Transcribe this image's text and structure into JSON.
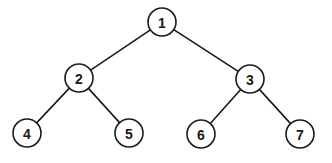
{
  "diagram": {
    "type": "binary-tree",
    "colors": {
      "stroke": "#1a1a1a",
      "fill": "#ffffff",
      "background": "#ffffff"
    },
    "node_radius": 14,
    "nodes": [
      {
        "id": "1",
        "label": "1",
        "x": 162,
        "y": 22
      },
      {
        "id": "2",
        "label": "2",
        "x": 79,
        "y": 78
      },
      {
        "id": "3",
        "label": "3",
        "x": 250,
        "y": 79
      },
      {
        "id": "4",
        "label": "4",
        "x": 27,
        "y": 133
      },
      {
        "id": "5",
        "label": "5",
        "x": 129,
        "y": 133
      },
      {
        "id": "6",
        "label": "6",
        "x": 201,
        "y": 134
      },
      {
        "id": "7",
        "label": "7",
        "x": 300,
        "y": 134
      }
    ],
    "edges": [
      {
        "from": "1",
        "to": "2"
      },
      {
        "from": "1",
        "to": "3"
      },
      {
        "from": "2",
        "to": "4"
      },
      {
        "from": "2",
        "to": "5"
      },
      {
        "from": "3",
        "to": "6"
      },
      {
        "from": "3",
        "to": "7"
      }
    ]
  }
}
